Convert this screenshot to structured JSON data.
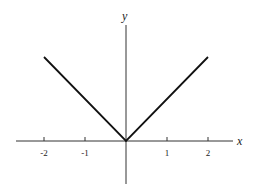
{
  "chart_data": {
    "type": "line",
    "title": "",
    "function": "y = |x|",
    "xlabel": "x",
    "ylabel": "y",
    "xlim": [
      -2.6,
      2.6
    ],
    "ylim": [
      -1.05,
      2.35
    ],
    "xticks": [
      -2,
      -1,
      1,
      2
    ],
    "xtick_labels": [
      "-2",
      "-1",
      "1",
      "2"
    ],
    "yticks": [],
    "grid": false,
    "legend": null,
    "series": [
      {
        "name": "|x|",
        "x": [
          -2,
          0,
          2
        ],
        "y": [
          2,
          0,
          2
        ]
      }
    ]
  },
  "layout": {
    "origin_px": [
      126,
      141
    ],
    "unit_x_px": 41,
    "unit_y_px": 42
  }
}
